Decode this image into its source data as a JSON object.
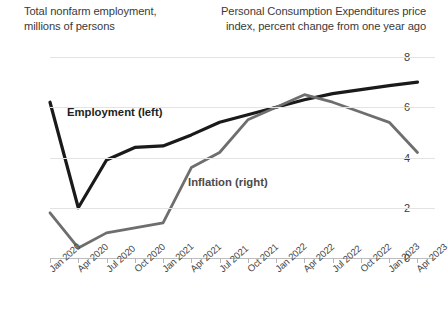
{
  "titles": {
    "left_line1": "Total nonfarm employment,",
    "left_line2": "millions of persons",
    "right_line1": "Personal Consumption Expenditures price",
    "right_line2": "index, percent change from one year ago"
  },
  "series_labels": {
    "employment": "Employment (left)",
    "inflation": "Inflation (right)"
  },
  "colors": {
    "employment": "#1a1a1a",
    "inflation": "#6e6e6e",
    "gridline": "#e3e3e3",
    "axis": "#bdbdbd",
    "text": "#3a3a3a"
  },
  "chart_data": {
    "type": "line",
    "xlabel": "",
    "grid": true,
    "legend": "inline-annotations",
    "x": [
      "Jan 2020",
      "Apr 2020",
      "Jul 2020",
      "Oct 2020",
      "Jan 2021",
      "Apr 2021",
      "Jul 2021",
      "Oct 2021",
      "Jan 2022",
      "Apr 2022",
      "Jul 2022",
      "Oct 2022",
      "Jan 2023",
      "Apr 2023"
    ],
    "axes": {
      "left": {
        "label": "Total nonfarm employment, millions of persons",
        "ticks": [
          120,
          130,
          140,
          150,
          160
        ],
        "ylim": [
          120,
          160
        ]
      },
      "right": {
        "label": "Personal Consumption Expenditures price index, percent change from one year ago",
        "ticks": [
          0,
          2,
          4,
          6,
          8
        ],
        "ylim": [
          0,
          8
        ]
      }
    },
    "series": [
      {
        "name": "Employment (left)",
        "axis": "left",
        "color": "#1a1a1a",
        "values": [
          151.0,
          130.0,
          139.5,
          142.0,
          142.3,
          144.5,
          147.0,
          148.5,
          150.0,
          151.5,
          152.7,
          153.5,
          154.3,
          155.0
        ]
      },
      {
        "name": "Inflation (right)",
        "axis": "right",
        "color": "#6e6e6e",
        "values": [
          1.8,
          0.4,
          1.0,
          1.2,
          1.4,
          3.6,
          4.2,
          5.5,
          6.0,
          6.5,
          6.2,
          5.8,
          5.4,
          4.2
        ]
      }
    ]
  }
}
